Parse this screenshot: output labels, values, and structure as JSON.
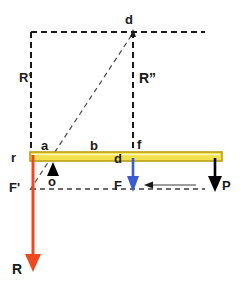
{
  "figure": {
    "background_color": "#ffffff",
    "colors": {
      "beam_fill": "#f2e14e",
      "beam_stroke": "#b9a014",
      "reaction_arrow": "#ec4a1e",
      "force_arrow": "#3b5bd4",
      "load_arrow": "#000000",
      "dashed_line": "#1a1a1a",
      "thin_dashed_line": "#3a3a3a",
      "label_text": "#1a1a1a"
    },
    "labels": {
      "r": "r",
      "a": "a",
      "b": "b",
      "d_beam": "d",
      "f": "f",
      "d_top": "d",
      "o": "o",
      "R_prime": "R'",
      "R_double_prime": "R”",
      "F_prime": "F'",
      "F": "F",
      "P": "P",
      "R": "R"
    },
    "elements": {
      "beam": "horizontal-yellow-beam",
      "fulcrum": "triangle-pivot-at-o",
      "reaction_arrow_label": "R",
      "force_arrow_label": "F",
      "load_arrow_label": "P",
      "horizontal_pull_arrow": "leftward-thin-arrow",
      "diagonal_construction_line": "F-prime-to-d",
      "vertical_construction_left": "R-prime",
      "vertical_construction_right": "R-double-prime"
    }
  }
}
